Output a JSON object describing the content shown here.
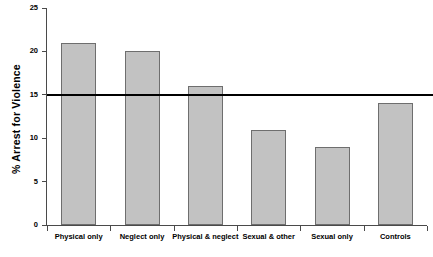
{
  "chart_data": {
    "type": "bar",
    "title": "",
    "xlabel": "",
    "ylabel": "% Arrest for Violence",
    "categories": [
      "Physical only",
      "Neglect only",
      "Physical & neglect",
      "Sexual & other",
      "Sexual only",
      "Controls"
    ],
    "values": [
      21,
      20,
      16,
      11,
      9,
      14
    ],
    "ylim": [
      0,
      25
    ],
    "yticks": [
      0,
      5,
      10,
      15,
      20,
      25
    ],
    "ytick_labels": [
      "0",
      "5",
      "10",
      "15",
      "20",
      "25"
    ],
    "grid": false,
    "legend": "none",
    "annotations": [
      {
        "name": "reference-line",
        "type": "hline",
        "value": 15,
        "color": "#000000",
        "label": ""
      }
    ],
    "bar_color": "#c2c2c2",
    "bar_border_color": "#6e6e6e",
    "axis_color": "#4a4a4a"
  },
  "caption": {
    "text": ""
  }
}
